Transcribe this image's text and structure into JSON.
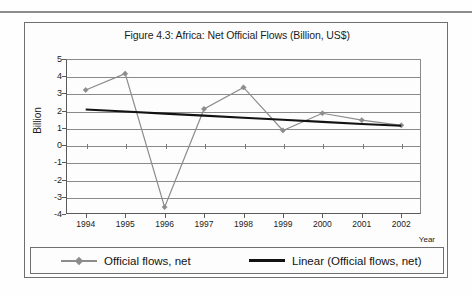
{
  "chart_data": {
    "type": "line",
    "title": "Figure 4.3: Africa: Net Official Flows (Billion, US$)",
    "xlabel": "Year",
    "ylabel": "Billion",
    "categories": [
      "1994",
      "1995",
      "1996",
      "1997",
      "1998",
      "1999",
      "2000",
      "2001",
      "2002"
    ],
    "x": [
      1994,
      1995,
      1996,
      1997,
      1998,
      1999,
      2000,
      2001,
      2002
    ],
    "ylim": [
      -4,
      5
    ],
    "yticks": [
      5,
      4,
      3,
      2,
      1,
      0,
      -1,
      -2,
      -3,
      -4
    ],
    "ytick_labels": [
      "5",
      "4",
      "3",
      "2",
      "1",
      "0",
      "-1",
      "-2",
      "-3",
      "-4"
    ],
    "grid": true,
    "legend_position": "bottom",
    "series": [
      {
        "name": "Official flows, net",
        "type": "line",
        "color": "#8c8c8c",
        "marker": "diamond",
        "values": [
          3.2,
          4.15,
          -3.6,
          2.1,
          3.35,
          0.85,
          1.85,
          1.45,
          1.15
        ]
      },
      {
        "name": "Linear (Official flows, net)",
        "type": "trendline",
        "color": "#121212",
        "marker": "none",
        "values": [
          2.07,
          1.95,
          1.83,
          1.71,
          1.59,
          1.47,
          1.35,
          1.23,
          1.12
        ]
      }
    ]
  },
  "legend": {
    "items": [
      {
        "label": "Official flows, net",
        "color": "#8c8c8c",
        "marker": "diamond"
      },
      {
        "label": "Linear (Official flows, net)",
        "color": "#121212",
        "marker": "none"
      }
    ]
  },
  "axes": {
    "y_title": "Billion",
    "x_title": "Year"
  },
  "colors": {
    "series": "#8c8c8c",
    "trend": "#121212",
    "grid": "#8a8a8a",
    "axis": "#5a5a5a",
    "frame": "#6f6f6f",
    "text": "#1c1c1c",
    "rule": "#8d8d8d"
  }
}
